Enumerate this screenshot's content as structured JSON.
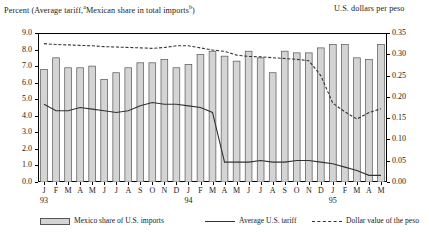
{
  "header": {
    "left_label": "Percent (Average tariff,",
    "left_label_sup_a": "a",
    "left_label_mid": "Mexican share in total imports",
    "left_label_sup_b": "b",
    "left_label_close": ")",
    "right_label": "U.S. dollars per peso"
  },
  "legend": {
    "items": [
      {
        "key": "bar",
        "label": "Mexico share of U.S. imports"
      },
      {
        "key": "solid",
        "label": "Average U.S. tariff"
      },
      {
        "key": "dash",
        "label": "Dollar value of the peso"
      }
    ]
  },
  "colors": {
    "bar_fill": "#d4d4d4",
    "bar_stroke": "#555555",
    "line_tariff": "#333333",
    "line_peso": "#333333",
    "axis": "#000000",
    "background": "#ffffff"
  },
  "chart_data": {
    "type": "bar",
    "xlabel": "",
    "ylabel": "Percent",
    "y2label": "U.S. dollars per peso",
    "ylim": [
      0.0,
      9.0
    ],
    "y2lim": [
      0.0,
      0.35
    ],
    "ytick_labels": [
      "0.0",
      "1.0",
      "2.0",
      "3.0",
      "4.0",
      "5.0",
      "6.0",
      "7.0",
      "8.0",
      "9.0"
    ],
    "ytick_values": [
      0,
      1,
      2,
      3,
      4,
      5,
      6,
      7,
      8,
      9
    ],
    "y2tick_labels": [
      "0.00",
      "0.05",
      "0.10",
      "0.15",
      "0.20",
      "0.25",
      "0.30",
      "0.35"
    ],
    "y2tick_values": [
      0.0,
      0.05,
      0.1,
      0.15,
      0.2,
      0.25,
      0.3,
      0.35
    ],
    "grid": false,
    "legend_position": "bottom",
    "categories": [
      "J",
      "F",
      "M",
      "A",
      "M",
      "J",
      "J",
      "A",
      "S",
      "O",
      "N",
      "D",
      "J",
      "F",
      "M",
      "A",
      "M",
      "J",
      "J",
      "A",
      "S",
      "O",
      "N",
      "D",
      "J",
      "F",
      "M",
      "A",
      "M"
    ],
    "year_labels": [
      {
        "text": "93",
        "index": 0
      },
      {
        "text": "94",
        "index": 12
      },
      {
        "text": "95",
        "index": 24
      }
    ],
    "series": [
      {
        "name": "Mexico share of U.S. imports",
        "type": "bar",
        "axis": "left",
        "values": [
          6.8,
          7.5,
          6.9,
          6.9,
          7.0,
          6.2,
          6.6,
          6.9,
          7.2,
          7.2,
          7.4,
          6.9,
          7.1,
          7.7,
          7.9,
          7.6,
          7.3,
          7.9,
          7.5,
          6.6,
          7.9,
          7.8,
          7.8,
          8.1,
          8.3,
          8.3,
          7.5,
          7.4,
          8.3
        ]
      },
      {
        "name": "Average U.S. tariff",
        "type": "line",
        "axis": "left",
        "values": [
          4.7,
          4.3,
          4.3,
          4.5,
          4.4,
          4.3,
          4.2,
          4.3,
          4.6,
          4.8,
          4.7,
          4.7,
          4.6,
          4.5,
          4.2,
          1.2,
          1.2,
          1.2,
          1.3,
          1.2,
          1.2,
          1.3,
          1.3,
          1.2,
          1.1,
          0.9,
          0.7,
          0.4,
          0.4
        ]
      },
      {
        "name": "Dollar value of the peso",
        "type": "line",
        "axis": "right",
        "values": [
          0.325,
          0.323,
          0.322,
          0.321,
          0.32,
          0.318,
          0.317,
          0.316,
          0.315,
          0.314,
          0.316,
          0.32,
          0.32,
          0.315,
          0.31,
          0.307,
          0.298,
          0.295,
          0.294,
          0.292,
          0.29,
          0.288,
          0.285,
          0.25,
          0.185,
          0.165,
          0.148,
          0.163,
          0.172
        ]
      }
    ]
  }
}
